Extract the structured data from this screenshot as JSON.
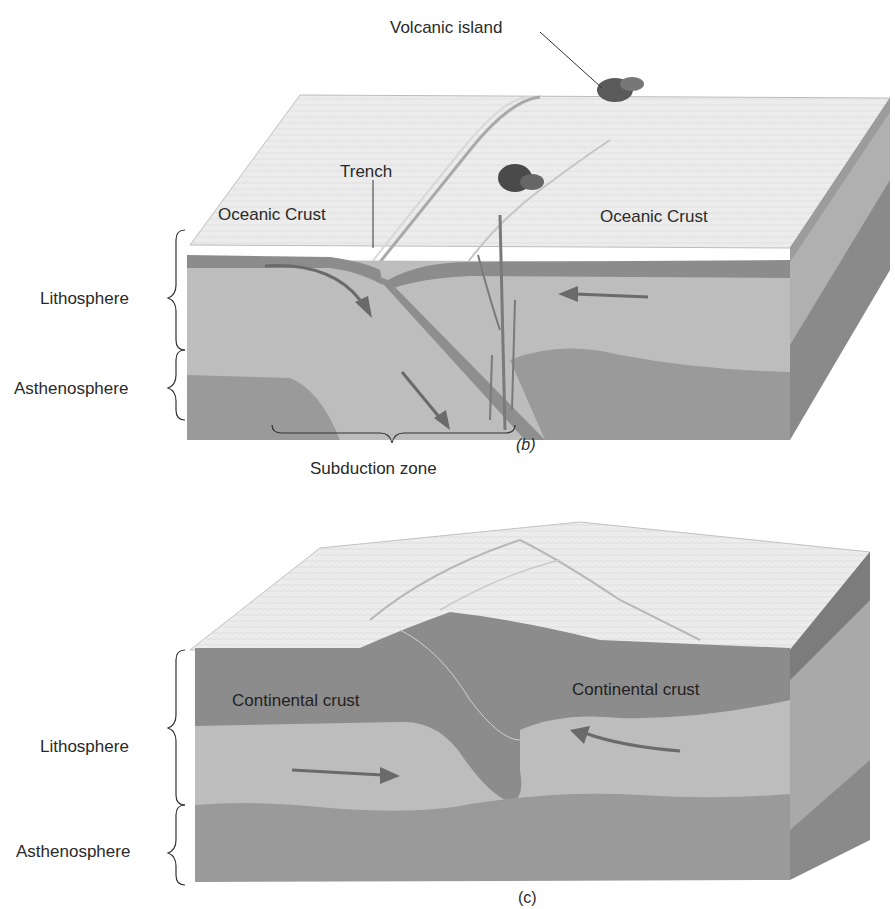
{
  "figure": {
    "panels": [
      {
        "id": "b",
        "caption": "(b)",
        "labels": {
          "volcanic_island": "Volcanic island",
          "trench": "Trench",
          "oceanic_crust_left": "Oceanic Crust",
          "oceanic_crust_right": "Oceanic Crust",
          "lithosphere": "Lithosphere",
          "asthenosphere": "Asthenosphere",
          "subduction_zone": "Subduction zone"
        }
      },
      {
        "id": "c",
        "caption": "(c)",
        "labels": {
          "continental_crust_left": "Continental crust",
          "continental_crust_right": "Continental crust",
          "lithosphere": "Lithosphere",
          "asthenosphere": "Asthenosphere"
        }
      }
    ],
    "colors": {
      "surface": "#ececec",
      "crust_dark": "#8c8c8c",
      "lithosphere": "#bdbdbd",
      "asthenosphere": "#9a9a9a",
      "side_face": "#7a7a7a",
      "arrow": "#6a6a6a",
      "text": "#2a2a2a"
    }
  }
}
